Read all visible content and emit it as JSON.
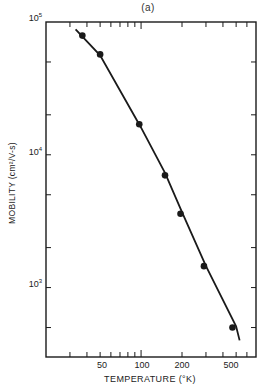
{
  "chart_data": {
    "type": "scatter",
    "title": "(a)",
    "xlabel": "TEMPERATURE (°K)",
    "ylabel": "MOBILITY (cm²/V-s)",
    "xscale": "log",
    "yscale": "log",
    "xlim": [
      20,
      700
    ],
    "ylim": [
      300,
      100000
    ],
    "x_tick_labels": [
      "50",
      "100",
      "200",
      "500"
    ],
    "x_tick_values": [
      50,
      100,
      200,
      500
    ],
    "y_tick_labels": [
      "10^3",
      "10^4",
      "10^5"
    ],
    "y_tick_values": [
      1000,
      10000,
      100000
    ],
    "grid": false,
    "legend": null,
    "series": [
      {
        "name": "measured",
        "style": "markers",
        "x": [
          37,
          50,
          97,
          150,
          195,
          290,
          470
        ],
        "y": [
          79000,
          57000,
          17000,
          7000,
          3600,
          1450,
          500
        ]
      },
      {
        "name": "fit",
        "style": "line",
        "x": [
          33,
          50,
          100,
          150,
          200,
          300,
          500,
          530
        ],
        "y": [
          88000,
          56000,
          16000,
          7300,
          3700,
          1450,
          510,
          400
        ]
      }
    ]
  },
  "labels": {
    "title": "(a)",
    "xlabel": "TEMPERATURE (°K)",
    "ylabel": "MOBILITY (cm²/V-s)",
    "ytick_base": "10",
    "ytick_exps": [
      "5",
      "4",
      "3"
    ],
    "xticks": [
      "50",
      "100",
      "200",
      "500"
    ]
  }
}
